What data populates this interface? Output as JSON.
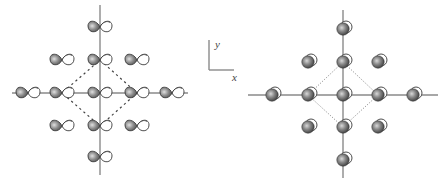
{
  "figure": {
    "left_panel": {
      "description": "p-orbital (dumbbell) lattice, square arrangement with dashed diamond unit cell",
      "center": [
        100,
        93
      ],
      "axis_h": [
        12,
        188
      ],
      "axis_v": [
        5,
        175
      ],
      "orbital_type": "p-orbital",
      "orbitals": [
        [
          100,
          27
        ],
        [
          62,
          60
        ],
        [
          100,
          60
        ],
        [
          137,
          60
        ],
        [
          28,
          93
        ],
        [
          62,
          93
        ],
        [
          100,
          93
        ],
        [
          137,
          93
        ],
        [
          172,
          93
        ],
        [
          62,
          126
        ],
        [
          100,
          126
        ],
        [
          137,
          126
        ],
        [
          100,
          157
        ]
      ],
      "unit_cell": [
        [
          100,
          60
        ],
        [
          137,
          93
        ],
        [
          100,
          126
        ],
        [
          62,
          93
        ]
      ]
    },
    "coordinate_frame": {
      "y_label": "y",
      "x_label": "x"
    },
    "right_panel": {
      "description": "s-orbital (sphere) lattice, square arrangement with dotted diamond unit cell",
      "center": [
        343,
        95
      ],
      "axis_h": [
        248,
        438
      ],
      "axis_v": [
        10,
        178
      ],
      "orbital_type": "s-orbital",
      "orbitals": [
        [
          343,
          29
        ],
        [
          308,
          62
        ],
        [
          343,
          62
        ],
        [
          378,
          62
        ],
        [
          272,
          95
        ],
        [
          308,
          95
        ],
        [
          343,
          95
        ],
        [
          378,
          95
        ],
        [
          413,
          95
        ],
        [
          308,
          127
        ],
        [
          343,
          127
        ],
        [
          378,
          127
        ],
        [
          343,
          160
        ]
      ],
      "unit_cell": [
        [
          343,
          62
        ],
        [
          378,
          95
        ],
        [
          343,
          127
        ],
        [
          308,
          95
        ]
      ]
    },
    "colors": {
      "axis": "#8a8a8a",
      "orbital_dark": "#6e6e6e",
      "orbital_light": "#ffffff",
      "outline": "#3a3a3a"
    }
  }
}
